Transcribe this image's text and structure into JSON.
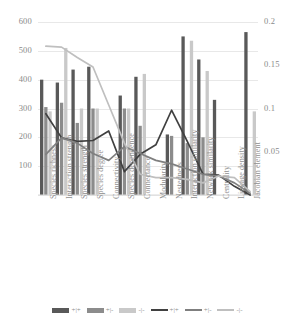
{
  "chart_data": {
    "type": "bar",
    "title": "",
    "xlabel": "",
    "ylabel": "",
    "y2label": "",
    "grid": true,
    "legend_position": "bottom",
    "ylim": [
      0,
      600
    ],
    "y2lim": [
      0,
      0.2
    ],
    "yticks": [
      "0",
      "100",
      "200",
      "300",
      "400",
      "500",
      "600"
    ],
    "y2ticks": [
      "0",
      "0.05",
      "0.1",
      "0.15",
      "0.2"
    ],
    "categories": [
      "Species richness",
      "Interaction strength",
      "Species strength",
      "Species degree",
      "Connectivity",
      "Species dependence",
      "Connectance",
      "Modularity",
      "Nestedness",
      "Interaction similarity",
      "Network similarity",
      "Centrality",
      "Linkage density",
      "Jacobian element"
    ],
    "bar_series": [
      {
        "name": "+|+",
        "axis": "left",
        "color": "#595959",
        "values": [
          400,
          390,
          435,
          445,
          0,
          345,
          410,
          0,
          210,
          550,
          470,
          330,
          0,
          565
        ]
      },
      {
        "name": "+|-",
        "axis": "left",
        "color": "#8c8c8c",
        "values": [
          305,
          320,
          250,
          300,
          0,
          300,
          240,
          0,
          205,
          180,
          200,
          0,
          0,
          0
        ]
      },
      {
        "name": "-|-",
        "axis": "left",
        "color": "#c9c9c9",
        "values": [
          290,
          510,
          300,
          300,
          0,
          300,
          420,
          0,
          0,
          535,
          430,
          0,
          0,
          290
        ]
      }
    ],
    "line_series": [
      {
        "name": "+|+",
        "axis": "right",
        "color": "#404040",
        "values": [
          0.094,
          0.066,
          0.062,
          0.063,
          0.074,
          0.027,
          0.047,
          0.058,
          0.098,
          0.062,
          0.024,
          0.023,
          0.01,
          0.0
        ]
      },
      {
        "name": "+|-",
        "axis": "right",
        "color": "#7f7f7f",
        "values": [
          0.047,
          0.066,
          0.06,
          0.048,
          0.04,
          0.056,
          0.048,
          0.04,
          0.036,
          0.03,
          0.024,
          0.022,
          0.014,
          0.002
        ]
      },
      {
        "name": "-|-",
        "axis": "right",
        "color": "#bfbfbf",
        "values": [
          0.172,
          0.171,
          0.159,
          0.148,
          0.104,
          0.06,
          0.024,
          0.02,
          0.02,
          0.018,
          0.014,
          0.022,
          0.02,
          0.004
        ]
      }
    ]
  },
  "legend": {
    "entries": [
      {
        "label": "+|+",
        "kind": "bar",
        "color": "#595959"
      },
      {
        "label": "+|-",
        "kind": "bar",
        "color": "#8c8c8c"
      },
      {
        "label": "-|-",
        "kind": "bar",
        "color": "#c9c9c9"
      },
      {
        "label": "+|+",
        "kind": "line",
        "color": "#404040"
      },
      {
        "label": "+|-",
        "kind": "line",
        "color": "#7f7f7f"
      },
      {
        "label": "-|-",
        "kind": "line",
        "color": "#bfbfbf"
      }
    ]
  }
}
